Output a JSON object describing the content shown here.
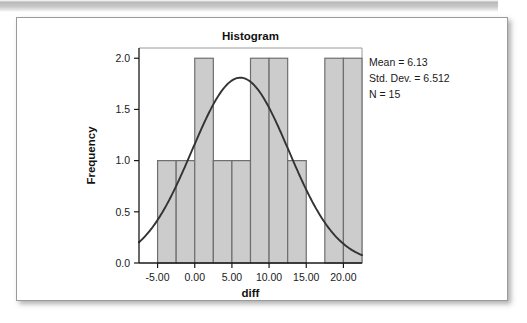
{
  "figure": {
    "title": "Histogram",
    "background_color": "#ffffff",
    "border_color": "#9a9a9a"
  },
  "stats_annotation": {
    "mean_label": "Mean = 6.13",
    "std_dev_label": "Std. Dev. = 6.512",
    "n_label": "N = 15"
  },
  "chart_data": {
    "type": "bar",
    "title": "Histogram",
    "xlabel": "diff",
    "ylabel": "Frequency",
    "xlim": [
      -7.5,
      22.5
    ],
    "ylim": [
      0,
      2.1
    ],
    "grid": false,
    "legend": false,
    "bar_fill_color": "#cccccc",
    "bar_edge_color": "#6e6e6e",
    "curve_color": "#333333",
    "x_tick_labels": [
      "-5.00",
      "0.00",
      "5.00",
      "10.00",
      "15.00",
      "20.00"
    ],
    "x_tick_values": [
      -5,
      0,
      5,
      10,
      15,
      20
    ],
    "y_tick_labels": [
      "0.0",
      "0.5",
      "1.0",
      "1.5",
      "2.0"
    ],
    "y_tick_values": [
      0,
      0.5,
      1.0,
      1.5,
      2.0
    ],
    "bin_width": 2.5,
    "bins": [
      {
        "left": -5.0,
        "right": -2.5,
        "value": 1
      },
      {
        "left": -2.5,
        "right": 0.0,
        "value": 1
      },
      {
        "left": 0.0,
        "right": 2.5,
        "value": 2
      },
      {
        "left": 2.5,
        "right": 5.0,
        "value": 1
      },
      {
        "left": 5.0,
        "right": 7.5,
        "value": 1
      },
      {
        "left": 7.5,
        "right": 10.0,
        "value": 2
      },
      {
        "left": 10.0,
        "right": 12.5,
        "value": 2
      },
      {
        "left": 12.5,
        "right": 15.0,
        "value": 1
      },
      {
        "left": 15.0,
        "right": 17.5,
        "value": 0
      },
      {
        "left": 17.5,
        "right": 20.0,
        "value": 2
      },
      {
        "left": 20.0,
        "right": 22.5,
        "value": 2
      }
    ],
    "normal_curve": {
      "mean": 6.13,
      "std_dev": 6.512,
      "n": 15,
      "peak_value": 1.81,
      "description": "normal distribution overlay"
    }
  }
}
